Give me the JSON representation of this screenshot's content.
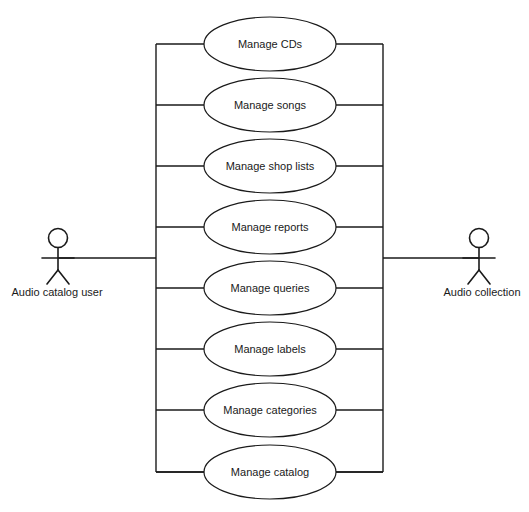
{
  "diagram": {
    "type": "uml-use-case-diagram",
    "background_color": "#ffffff",
    "stroke_color": "#1a1a1a",
    "system_boundary": {
      "name": "system-boundary",
      "left_x": 156,
      "right_x": 383,
      "top_y": 44,
      "bottom_y": 472
    },
    "use_cases": [
      {
        "label": "Manage CDs",
        "cx": 270,
        "cy": 44,
        "rx": 66,
        "ry": 27
      },
      {
        "label": "Manage songs",
        "cx": 270,
        "cy": 105,
        "rx": 66,
        "ry": 27
      },
      {
        "label": "Manage shop lists",
        "cx": 270,
        "cy": 166,
        "rx": 66,
        "ry": 27
      },
      {
        "label": "Manage reports",
        "cx": 270,
        "cy": 227,
        "rx": 66,
        "ry": 27
      },
      {
        "label": "Manage queries",
        "cx": 270,
        "cy": 288,
        "rx": 66,
        "ry": 27
      },
      {
        "label": "Manage labels",
        "cx": 270,
        "cy": 349,
        "rx": 66,
        "ry": 27
      },
      {
        "label": "Manage categories",
        "cx": 270,
        "cy": 410,
        "rx": 66,
        "ry": 27
      },
      {
        "label": "Manage catalog",
        "cx": 270,
        "cy": 472,
        "rx": 66,
        "ry": 27
      }
    ],
    "actors": [
      {
        "id": "audio-catalog-user",
        "label": "Audio catalog user",
        "side": "left",
        "x": 58,
        "head_cy": 238,
        "label_x": 57,
        "label_y": 293,
        "assoc_y": 258,
        "assoc_to_x": 156
      },
      {
        "id": "audio-collection",
        "label": "Audio collection",
        "side": "right",
        "x": 479,
        "head_cy": 238,
        "label_x": 482,
        "label_y": 293,
        "assoc_y": 258,
        "assoc_to_x": 383
      }
    ]
  }
}
